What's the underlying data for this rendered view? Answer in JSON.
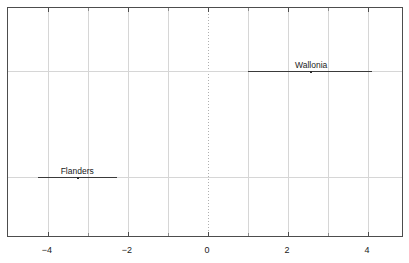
{
  "chart_data": {
    "type": "scatter",
    "title": "",
    "subtitle": "",
    "xlabel": "",
    "ylabel": "",
    "xlim": [
      -5.0,
      4.9
    ],
    "ylim": [
      0,
      1
    ],
    "grid": true,
    "legend": false,
    "xticks": [
      {
        "value": -4,
        "label": "−4"
      },
      {
        "value": -2,
        "label": "−2"
      },
      {
        "value": 0,
        "label": "0"
      },
      {
        "value": 2,
        "label": "2"
      },
      {
        "value": 4,
        "label": "4"
      }
    ],
    "xminor_ticks": [
      -3,
      -1,
      1,
      3
    ],
    "vertical_gridlines": [
      -4,
      -3,
      -2,
      -1,
      0,
      1,
      2,
      3,
      4
    ],
    "zero_reference_line": 0,
    "yticks": [],
    "series": [
      {
        "name": "Wallonia",
        "label": "Wallonia",
        "estimate": 2.58,
        "low": 1.0,
        "high": 4.1,
        "y_position": 0.727,
        "label_offset_x": 2.58
      },
      {
        "name": "Flanders",
        "label": "Flanders",
        "estimate": -3.25,
        "low": -4.25,
        "high": -2.28,
        "y_position": 0.266,
        "label_offset_x": -3.27
      }
    ]
  },
  "colors": {
    "frame": "#4d4d4d",
    "gridline": "#d6d6d6",
    "zero_line": "#b0b0b0",
    "interval": "#3a3a3a",
    "marker": "#2b2b2b",
    "text": "#1a1a1a",
    "background": "#ffffff"
  }
}
